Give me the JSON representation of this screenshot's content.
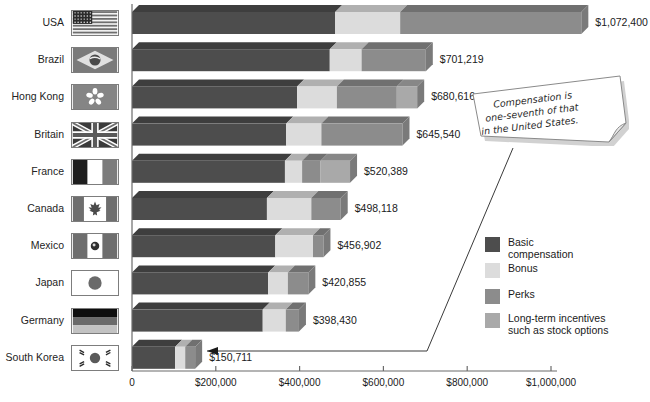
{
  "chart_data": {
    "type": "bar",
    "subtype": "stacked-horizontal-3d",
    "title": "",
    "xlabel": "",
    "ylabel": "",
    "xlim": [
      0,
      1000000
    ],
    "grid": false,
    "legend_position": "right-bottom",
    "categories": [
      "USA",
      "Brazil",
      "Hong Kong",
      "Britain",
      "France",
      "Canada",
      "Mexico",
      "Japan",
      "Germany",
      "South Korea"
    ],
    "series": [
      {
        "name": "Basic compensation",
        "color": "#4d4d4d",
        "values": [
          485000,
          472000,
          394000,
          368000,
          365000,
          322000,
          342000,
          325000,
          312000,
          103000
        ]
      },
      {
        "name": "Bonus",
        "color": "#dcdcdc",
        "values": [
          640000,
          548000,
          489000,
          452000,
          406000,
          428000,
          432000,
          372000,
          367000,
          127000
        ]
      },
      {
        "name": "Perks",
        "color": "#8c8c8c",
        "values": [
          1072400,
          701219,
          632000,
          645540,
          450000,
          498118,
          456902,
          420855,
          398430,
          150711
        ]
      },
      {
        "name": "Long-term incentives such as stock options",
        "color": "#a9a9a9",
        "values": [
          1072400,
          701219,
          680616,
          645540,
          520389,
          498118,
          456902,
          420855,
          398430,
          150711
        ]
      }
    ],
    "totals": [
      1072400,
      701219,
      680616,
      645540,
      520389,
      498118,
      456902,
      420855,
      398430,
      150711
    ],
    "value_labels": [
      "$1,072,400",
      "$701,219",
      "$680,616",
      "$645,540",
      "$520,389",
      "$498,118",
      "$456,902",
      "$420,855",
      "$398,430",
      "$150,711"
    ],
    "xticks": [
      0,
      200000,
      400000,
      600000,
      800000,
      1000000
    ],
    "xtick_labels": [
      "0",
      "$200,000",
      "$400,000",
      "$600,000",
      "$800,000",
      "$1,000,000"
    ]
  },
  "axis": {
    "tick_labels": [
      "0",
      "$200,000",
      "$400,000",
      "$600,000",
      "$800,000",
      "$1,000,000"
    ]
  },
  "countries": [
    {
      "label": "USA",
      "flag": "flag-usa",
      "value_label": "$1,072,400"
    },
    {
      "label": "Brazil",
      "flag": "flag-brazil",
      "value_label": "$701,219"
    },
    {
      "label": "Hong Kong",
      "flag": "flag-hong-kong",
      "value_label": "$680,616"
    },
    {
      "label": "Britain",
      "flag": "flag-britain",
      "value_label": "$645,540"
    },
    {
      "label": "France",
      "flag": "flag-france",
      "value_label": "$520,389"
    },
    {
      "label": "Canada",
      "flag": "flag-canada",
      "value_label": "$498,118"
    },
    {
      "label": "Mexico",
      "flag": "flag-mexico",
      "value_label": "$456,902"
    },
    {
      "label": "Japan",
      "flag": "flag-japan",
      "value_label": "$420,855"
    },
    {
      "label": "Germany",
      "flag": "flag-germany",
      "value_label": "$398,430"
    },
    {
      "label": "South Korea",
      "flag": "flag-south-korea",
      "value_label": "$150,711"
    }
  ],
  "legend": {
    "items": [
      {
        "label_line1": "Basic",
        "label_line2": "compensation",
        "color": "#4d4d4d"
      },
      {
        "label_line1": "Bonus",
        "label_line2": "",
        "color": "#dcdcdc"
      },
      {
        "label_line1": "Perks",
        "label_line2": "",
        "color": "#8c8c8c"
      },
      {
        "label_line1": "Long-term incentives",
        "label_line2": "such as stock options",
        "color": "#a9a9a9"
      }
    ]
  },
  "callout": {
    "line1": "Compensation is",
    "line2": "one-seventh of that",
    "line3": "in the United States."
  },
  "colors": {
    "basic": "#4d4d4d",
    "bonus": "#dcdcdc",
    "perks": "#8c8c8c",
    "longterm": "#a9a9a9",
    "axis": "#555555",
    "background": "#ffffff"
  }
}
